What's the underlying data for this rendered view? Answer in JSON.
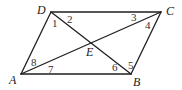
{
  "figure": {
    "type": "parallelogram-with-diagonals",
    "vertices": {
      "A": {
        "label": "A",
        "x": 21,
        "y": 74,
        "label_x": 9,
        "label_y": 84
      },
      "B": {
        "label": "B",
        "x": 131,
        "y": 74,
        "label_x": 133,
        "label_y": 86
      },
      "C": {
        "label": "C",
        "x": 161,
        "y": 12,
        "label_x": 166,
        "label_y": 15
      },
      "D": {
        "label": "D",
        "x": 51,
        "y": 12,
        "label_x": 37,
        "label_y": 14
      },
      "E": {
        "label": "E",
        "x": 91,
        "y": 43,
        "label_x": 86,
        "label_y": 56
      }
    },
    "sides": [
      {
        "from": "A",
        "to": "B"
      },
      {
        "from": "B",
        "to": "C"
      },
      {
        "from": "C",
        "to": "D"
      },
      {
        "from": "D",
        "to": "A"
      }
    ],
    "diagonals": [
      {
        "from": "A",
        "to": "C"
      },
      {
        "from": "D",
        "to": "B"
      }
    ],
    "angles": [
      {
        "label": "1",
        "x": 52,
        "y": 27
      },
      {
        "label": "2",
        "x": 67,
        "y": 23
      },
      {
        "label": "3",
        "x": 131,
        "y": 21
      },
      {
        "label": "4",
        "x": 145,
        "y": 29
      },
      {
        "label": "5",
        "x": 128,
        "y": 69
      },
      {
        "label": "6",
        "x": 112,
        "y": 71
      },
      {
        "label": "7",
        "x": 48,
        "y": 73
      },
      {
        "label": "8",
        "x": 31,
        "y": 66
      }
    ],
    "colors": {
      "stroke": "#1f1f1f",
      "text": "#1a1a1a",
      "background": "#ffffff"
    }
  }
}
